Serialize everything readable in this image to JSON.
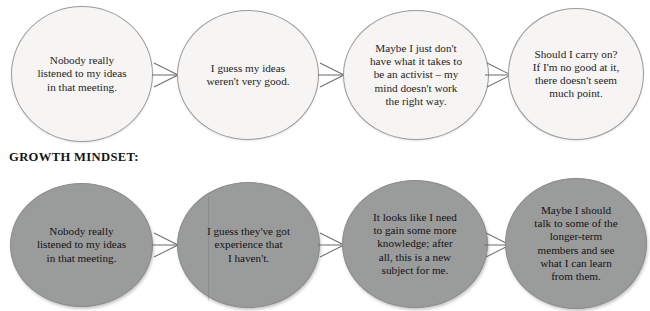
{
  "diagram": {
    "type": "flow-comparison",
    "background_color": "#ffffff",
    "rows": [
      {
        "id": "fixed-mindset",
        "label": "",
        "node_fill": "#f6f5f4",
        "node_border": "#9b9b9b",
        "text_color": "#232323",
        "nodes": [
          {
            "text": "Nobody really\nlistened to my ideas\nin that meeting."
          },
          {
            "text": "I guess my ideas\nweren't very good."
          },
          {
            "text": "Maybe I just don't\nhave what it takes to\nbe an activist – my\nmind doesn't work\nthe right way."
          },
          {
            "text": "Should I carry on?\nIf I'm no good at it,\nthere doesn't seem\nmuch point."
          }
        ]
      },
      {
        "id": "growth-mindset",
        "label": "GROWTH MINDSET:",
        "node_fill": "#9a9b9b",
        "node_border": "#8a8b8b",
        "text_color": "#131313",
        "nodes": [
          {
            "text": "Nobody really\nlistened to my ideas\nin that meeting."
          },
          {
            "text": "I guess they've got\nexperience that\nI haven't."
          },
          {
            "text": "It looks like I need\nto gain some more\nknowledge; after\nall, this is a new\nsubject for me."
          },
          {
            "text": "Maybe I should\ntalk to some of the\nlonger-term\nmembers and see\nwhat I can learn\nfrom them."
          }
        ]
      }
    ],
    "arrow_color": "#6f6f6f"
  }
}
